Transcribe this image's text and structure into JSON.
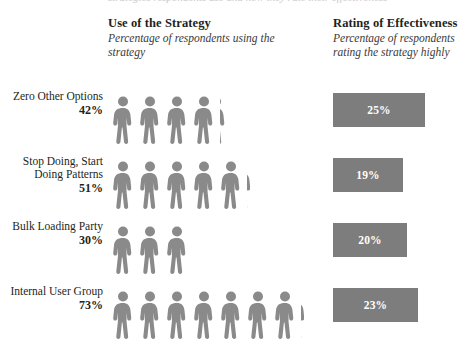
{
  "top_clipped_text": "strategies respondents use and how they rate their effectiveness",
  "columns": {
    "use": {
      "title": "Use of the Strategy",
      "subtitle": "Percentage of respondents\nusing the strategy"
    },
    "rating": {
      "title": "Rating of Effectiveness",
      "subtitle": "Percentage of respondents\nrating the strategy highly"
    }
  },
  "colors": {
    "figure": "#8a8a8a",
    "bar": "#7d7d7d",
    "bar_label": "#ffffff",
    "text": "#231f20",
    "background": "#ffffff"
  },
  "rows": [
    {
      "label": "Zero Other Options",
      "use_pct": "42%",
      "use_value": 42,
      "full_figures": 4,
      "partial": "tiny",
      "rating_pct": "25%",
      "rating_value": 25
    },
    {
      "label": "Stop Doing, Start\nDoing Patterns",
      "use_pct": "51%",
      "use_value": 51,
      "full_figures": 5,
      "partial": "small",
      "rating_pct": "19%",
      "rating_value": 19
    },
    {
      "label": "Bulk Loading Party",
      "use_pct": "30%",
      "use_value": 30,
      "full_figures": 3,
      "partial": "none",
      "rating_pct": "20%",
      "rating_value": 20
    },
    {
      "label": "Internal User Group",
      "use_pct": "73%",
      "use_value": 73,
      "full_figures": 7,
      "partial": "small",
      "rating_pct": "23%",
      "rating_value": 23
    }
  ],
  "chart_data": {
    "type": "bar",
    "title": "",
    "categories": [
      "Zero Other Options",
      "Stop Doing, Start Doing Patterns",
      "Bulk Loading Party",
      "Internal User Group"
    ],
    "series": [
      {
        "name": "Use of the Strategy",
        "unit": "percent",
        "representation": "pictogram",
        "icon_value": 10,
        "values": [
          42,
          51,
          30,
          73
        ]
      },
      {
        "name": "Rating of Effectiveness",
        "unit": "percent",
        "representation": "horizontal-bar",
        "values": [
          25,
          19,
          20,
          23
        ]
      }
    ],
    "xlabel": "",
    "ylabel": "",
    "xlim": [
      0,
      100
    ],
    "grid": false,
    "legend": "none",
    "annotations": [
      "Percentage of respondents using the strategy",
      "Percentage of respondents rating the strategy highly"
    ]
  }
}
